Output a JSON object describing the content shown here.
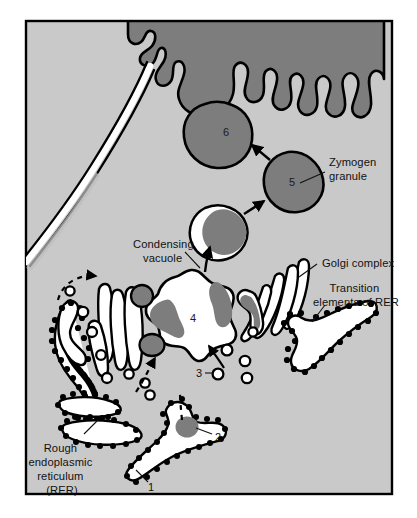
{
  "figure": {
    "frame": {
      "border_color": "#000000",
      "outer_background": "#ffffff",
      "cytoplasm_color": "#c9c9c9",
      "lumen_color": "#ffffff",
      "granule_color": "#7d7d7d",
      "membrane_color": "#000000"
    }
  },
  "labels": [
    {
      "id": "zymogen-granule",
      "text_lines": [
        "Zymogen",
        "granule"
      ],
      "x": 322,
      "y": 168
    },
    {
      "id": "condensing-vacuole",
      "text_lines": [
        "Condensing",
        "vacuole"
      ],
      "x": 135,
      "y": 249
    },
    {
      "id": "golgi-complex",
      "text_lines": [
        "Golgi complex"
      ],
      "x": 320,
      "y": 266
    },
    {
      "id": "transition-elements-of-rer",
      "text_lines": [
        "Transition",
        "elements of RER"
      ],
      "x": 317,
      "y": 297
    },
    {
      "id": "rough-endoplasmic-reticulum",
      "text_lines": [
        "Rough",
        "endoplasmic",
        "reticulum",
        "(RER)"
      ],
      "x": 62,
      "y": 455
    }
  ],
  "numbered_steps": [
    {
      "id": "step-1",
      "number": "1",
      "x": 151,
      "y": 487,
      "description": "Synthesis on rough ER ribosomes"
    },
    {
      "id": "step-2",
      "number": "2",
      "x": 216,
      "y": 437,
      "description": "Segregation in RER cisterna"
    },
    {
      "id": "step-3",
      "number": "3",
      "x": 200,
      "y": 375,
      "description": "Transport vesicle"
    },
    {
      "id": "step-4",
      "number": "4",
      "x": 193,
      "y": 318,
      "description": "Condensing vacuole"
    },
    {
      "id": "step-5",
      "number": "5",
      "x": 290,
      "y": 180,
      "description": "Zymogen granule"
    },
    {
      "id": "step-6",
      "number": "6",
      "x": 227,
      "y": 130,
      "description": "Exocytosis at apical surface"
    }
  ]
}
